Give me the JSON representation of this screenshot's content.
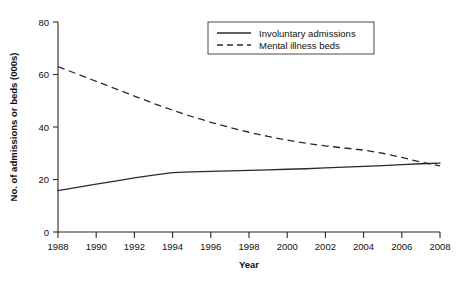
{
  "chart_data": {
    "type": "line",
    "title": "",
    "xlabel": "Year",
    "ylabel": "No. of admissions or beds (000s)",
    "xlim": [
      1988,
      2008
    ],
    "ylim": [
      0,
      80
    ],
    "grid": false,
    "legend_position": "upper-right",
    "xticks": [
      1988,
      1990,
      1992,
      1994,
      1996,
      1998,
      2000,
      2002,
      2004,
      2006,
      2008
    ],
    "xtick_labels": [
      "1988",
      "1990",
      "1992",
      "1994",
      "1996",
      "1998",
      "2000",
      "2002",
      "2004",
      "2006",
      "2008"
    ],
    "yticks": [
      0,
      20,
      40,
      60,
      80
    ],
    "ytick_labels": [
      "0",
      "20",
      "40",
      "60",
      "80"
    ],
    "x": [
      1988,
      1989,
      1990,
      1991,
      1992,
      1993,
      1994,
      1995,
      1996,
      1997,
      1998,
      1999,
      2000,
      2001,
      2002,
      2003,
      2004,
      2005,
      2006,
      2007,
      2008
    ],
    "series": [
      {
        "name": "Involuntary admissions",
        "style": "solid",
        "color": "#2b2b2b",
        "values": [
          15.8,
          17.0,
          18.2,
          19.4,
          20.6,
          21.7,
          22.6,
          22.9,
          23.1,
          23.3,
          23.5,
          23.7,
          23.9,
          24.1,
          24.4,
          24.7,
          25.0,
          25.3,
          25.7,
          26.0,
          26.2
        ]
      },
      {
        "name": "Mental illness beds",
        "style": "dashed",
        "color": "#2b2b2b",
        "values": [
          63.0,
          60.2,
          57.4,
          54.6,
          51.8,
          49.0,
          46.4,
          44.0,
          41.8,
          39.8,
          38.0,
          36.4,
          35.0,
          33.8,
          32.8,
          32.0,
          31.2,
          30.0,
          28.4,
          26.6,
          25.2
        ]
      }
    ],
    "legend_entries": [
      {
        "label": "Involuntary admissions",
        "style": "solid"
      },
      {
        "label": "Mental illness beds",
        "style": "dashed"
      }
    ]
  },
  "caption": {
    "text": ""
  }
}
